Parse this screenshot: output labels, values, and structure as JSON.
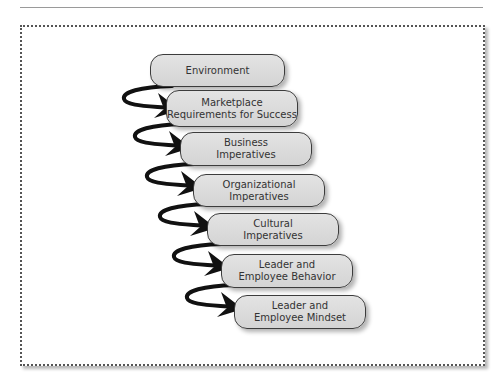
{
  "diagram": {
    "type": "cascading-flow",
    "direction": "top-to-bottom",
    "steps": [
      {
        "lines": [
          "Environment"
        ]
      },
      {
        "lines": [
          "Marketplace",
          "Requirements for Success"
        ]
      },
      {
        "lines": [
          "Business",
          "Imperatives"
        ]
      },
      {
        "lines": [
          "Organizational",
          "Imperatives"
        ]
      },
      {
        "lines": [
          "Cultural",
          "Imperatives"
        ]
      },
      {
        "lines": [
          "Leader and",
          "Employee Behavior"
        ]
      },
      {
        "lines": [
          "Leader and",
          "Employee Mindset"
        ]
      }
    ],
    "colors": {
      "box_fill": "#dcdcdc",
      "box_border": "#3c3c3c",
      "arrow": "#111111",
      "frame_border": "#555555"
    }
  }
}
